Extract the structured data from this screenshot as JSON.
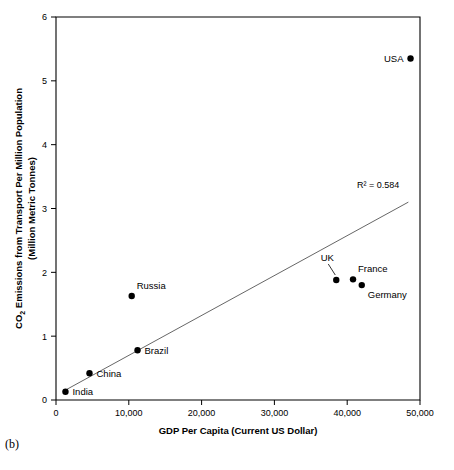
{
  "figure": {
    "caption": "(b)"
  },
  "chart_data": {
    "type": "scatter",
    "title": "",
    "xlabel": "GDP Per Capita (Current US Dollar)",
    "ylabel_line1": "CO₂ Emissions from Transport Per Million Population",
    "ylabel_line2": "(Million Metric Tonnes)",
    "ylabel_prefix": "CO",
    "ylabel_sub": "2",
    "ylabel_rest": " Emissions from Transport Per Million Population",
    "xlim": [
      0,
      50000
    ],
    "ylim": [
      0,
      6
    ],
    "xticks": [
      0,
      10000,
      20000,
      30000,
      40000,
      50000
    ],
    "xticklabels": [
      "0",
      "10,000",
      "20,000",
      "30,000",
      "40,000",
      "50,000"
    ],
    "yticks": [
      0,
      1,
      2,
      3,
      4,
      5,
      6
    ],
    "yticklabels": [
      "0",
      "1",
      "2",
      "3",
      "4",
      "5",
      "6"
    ],
    "grid": false,
    "legend": "none",
    "annotation": "R² = 0.584",
    "r_squared": 0.584,
    "marker_color": "#000000",
    "trendline_color": "#555555",
    "trendline": {
      "x_start": 900,
      "y_start": 0.13,
      "x_end": 48400,
      "y_end": 3.1
    },
    "points": [
      {
        "label": "India",
        "x": 1300,
        "y": 0.13,
        "label_pos": "right"
      },
      {
        "label": "China",
        "x": 4600,
        "y": 0.42,
        "label_pos": "right"
      },
      {
        "label": "Brazil",
        "x": 11200,
        "y": 0.78,
        "label_pos": "right"
      },
      {
        "label": "Russia",
        "x": 10400,
        "y": 1.63,
        "label_pos": "above-right"
      },
      {
        "label": "UK",
        "x": 38500,
        "y": 1.88,
        "label_pos": "leader-above"
      },
      {
        "label": "France",
        "x": 40800,
        "y": 1.89,
        "label_pos": "above-right"
      },
      {
        "label": "Germany",
        "x": 42000,
        "y": 1.8,
        "label_pos": "below-right"
      },
      {
        "label": "USA",
        "x": 48700,
        "y": 5.35,
        "label_pos": "left"
      }
    ]
  }
}
